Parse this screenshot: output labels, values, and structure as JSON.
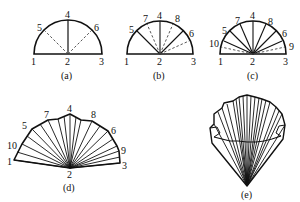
{
  "figure": {
    "panels": [
      {
        "id": "a",
        "caption": "(a)",
        "labels": [
          "1",
          "2",
          "3",
          "4",
          "5",
          "6"
        ]
      },
      {
        "id": "b",
        "caption": "(b)",
        "labels": [
          "1",
          "2",
          "3",
          "4",
          "5",
          "6",
          "7",
          "8"
        ]
      },
      {
        "id": "c",
        "caption": "(c)",
        "labels": [
          "1",
          "2",
          "3",
          "4",
          "5",
          "6",
          "7",
          "8",
          "9",
          "10"
        ]
      },
      {
        "id": "d",
        "caption": "(d)",
        "labels": [
          "1",
          "2",
          "3",
          "4",
          "5",
          "6",
          "7",
          "8",
          "9",
          "10"
        ]
      },
      {
        "id": "e",
        "caption": "(e)"
      }
    ]
  },
  "a": {
    "caption": "(a)",
    "l1": "1",
    "l2": "2",
    "l3": "3",
    "l4": "4",
    "l5": "5",
    "l6": "6"
  },
  "b": {
    "caption": "(b)",
    "l1": "1",
    "l2": "2",
    "l3": "3",
    "l4": "4",
    "l5": "5",
    "l6": "6",
    "l7": "7",
    "l8": "8"
  },
  "c": {
    "caption": "(c)",
    "l1": "1",
    "l2": "2",
    "l3": "3",
    "l4": "4",
    "l5": "5",
    "l6": "6",
    "l7": "7",
    "l8": "8",
    "l9": "9",
    "l10": "10"
  },
  "d": {
    "caption": "(d)",
    "l1": "1",
    "l2": "2",
    "l3": "3",
    "l4": "4",
    "l5": "5",
    "l6": "6",
    "l7": "7",
    "l8": "8",
    "l9": "9",
    "l10": "10"
  },
  "e": {
    "caption": "(e)"
  }
}
